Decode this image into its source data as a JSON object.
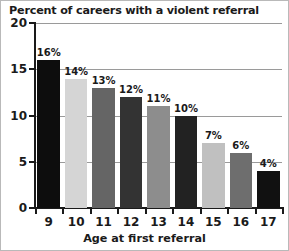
{
  "chart_data": {
    "type": "bar",
    "title": "Percent of careers with a violent referral",
    "xlabel": "Age at first referral",
    "ylabel": "",
    "categories": [
      "9",
      "10",
      "11",
      "12",
      "13",
      "14",
      "15",
      "16",
      "17"
    ],
    "values": [
      16,
      14,
      13,
      12,
      11,
      10,
      7,
      6,
      4
    ],
    "value_labels": [
      "16%",
      "14%",
      "13%",
      "12%",
      "11%",
      "10%",
      "7%",
      "6%",
      "4%"
    ],
    "bar_colors": [
      "#0d0d0d",
      "#d5d5d5",
      "#656565",
      "#333333",
      "#8d8d8d",
      "#222222",
      "#c0c0c0",
      "#6e6e6e",
      "#111111"
    ],
    "ylim": [
      0,
      20
    ],
    "yticks": [
      0,
      5,
      10,
      15,
      20
    ],
    "ytick_labels": [
      "0",
      "5",
      "10",
      "15",
      "20"
    ],
    "grid": true,
    "grid_color": "#9a9a9a",
    "legend": false,
    "axis_color": "#1a1a1a",
    "background": "#ffffff"
  }
}
